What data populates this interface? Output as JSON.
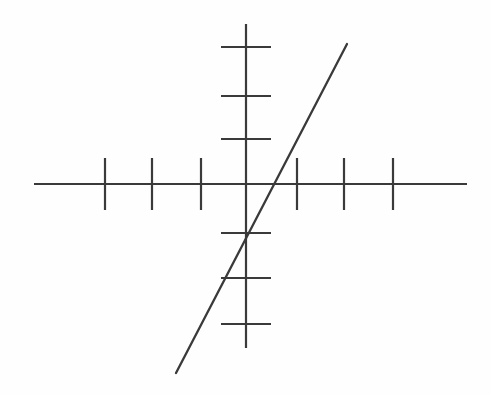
{
  "figure": {
    "title": "",
    "background_color": "#fefefe",
    "stroke_color": "#3a3a3a",
    "width": 491,
    "height": 395
  },
  "chart_data": {
    "type": "line",
    "title": "",
    "subtitle": "",
    "xlabel": "",
    "ylabel": "",
    "grid": false,
    "legend": null,
    "annotations": [],
    "axes": {
      "origin_px": [
        246,
        184
      ],
      "unit_px_x": 48,
      "unit_px_y": 46,
      "x_axis": {
        "label": "",
        "start_px": [
          34,
          184
        ],
        "end_px": [
          467,
          184
        ],
        "xlim": [
          -4.4,
          4.6
        ],
        "tick_values": [
          -3,
          -2,
          -1,
          1,
          2,
          3
        ],
        "tick_labels": [
          "",
          "",
          "",
          "",
          "",
          ""
        ],
        "tick_positions_px": [
          105,
          152,
          201,
          297,
          344,
          393
        ],
        "tick_half_length_px": 26
      },
      "y_axis": {
        "label": "",
        "start_px": [
          246,
          24
        ],
        "end_px": [
          246,
          348
        ],
        "ylim": [
          -3.6,
          3.5
        ],
        "tick_values": [
          3,
          2,
          1,
          -1,
          -2,
          -3
        ],
        "tick_labels": [
          "",
          "",
          "",
          "",
          "",
          ""
        ],
        "tick_positions_px": [
          47,
          96,
          139,
          233,
          278,
          324
        ],
        "tick_half_length_px": 25
      }
    },
    "series": [
      {
        "name": "line",
        "type": "line",
        "color": "#3a3a3a",
        "slope": 2,
        "intercept": -1,
        "x": [
          -1.46,
          2.1
        ],
        "y": [
          -3.9,
          3.05
        ],
        "start_px": [
          176,
          373
        ],
        "end_px": [
          347,
          44
        ],
        "x_intercept": 0.5,
        "y_intercept": -1
      }
    ]
  }
}
